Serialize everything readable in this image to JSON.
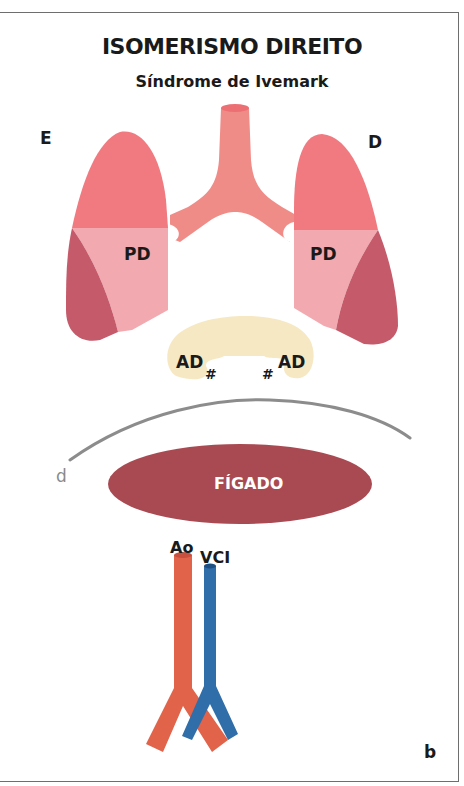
{
  "figure": {
    "title": "ISOMERISMO DIREITO",
    "subtitle": "Síndrome de Ivemark",
    "panel_label": "b"
  },
  "labels": {
    "left_side": "E",
    "right_side": "D",
    "left_lung": "PD",
    "right_lung": "PD",
    "left_atrium": "AD",
    "right_atrium": "AD",
    "atrium_marker": "#",
    "diaphragm": "d",
    "liver": "FÍGADO",
    "aorta": "Ao",
    "ivc": "VCI"
  },
  "colors": {
    "upper_lobe": "#f07a80",
    "middle_lobe": "#f2aab0",
    "lower_lobe": "#c45a6a",
    "trachea": "#f08c88",
    "atria": "#f7e8c4",
    "diaphragm": "#8c8c8c",
    "liver": "#a94a52",
    "aorta": "#e0634a",
    "ivc": "#2f6ea8"
  }
}
